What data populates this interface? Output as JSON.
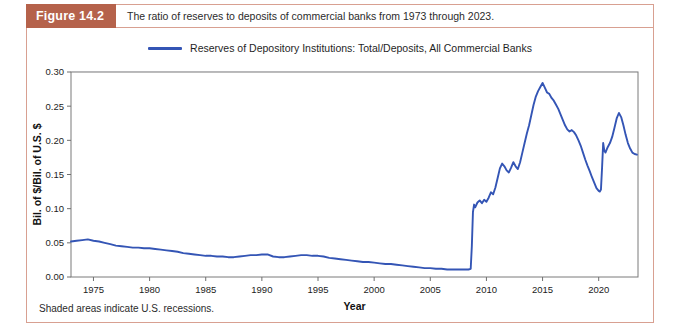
{
  "figure": {
    "tag": "Figure 14.2",
    "caption": "The ratio of reserves to deposits of commercial banks from 1973 through 2023.",
    "footnote": "Shaded areas indicate U.S. recessions.",
    "tag_bg_color": "#b5624b",
    "border_color": "#d8a091"
  },
  "chart_data": {
    "type": "line",
    "title": "",
    "xlabel": "Year",
    "ylabel": "Bil. of $/Bil. of U.S. $",
    "xlim": [
      1973,
      2023.5
    ],
    "ylim": [
      0.0,
      0.3
    ],
    "xticks": [
      1975,
      1980,
      1985,
      1990,
      1995,
      2000,
      2005,
      2010,
      2015,
      2020
    ],
    "yticks": [
      0.0,
      0.05,
      0.1,
      0.15,
      0.2,
      0.25,
      0.3
    ],
    "xtick_labels": [
      "1975",
      "1980",
      "1985",
      "1990",
      "1995",
      "2000",
      "2005",
      "2010",
      "2015",
      "2020"
    ],
    "ytick_labels": [
      "0.00",
      "0.05",
      "0.10",
      "0.15",
      "0.20",
      "0.25",
      "0.30"
    ],
    "grid": true,
    "legend_position": "top-center",
    "line_color": "#3455b5",
    "recession_color": "#dde7ee",
    "series": [
      {
        "name": "Reserves of Depository Institutions: Total/Deposits, All Commercial Banks",
        "color": "#3455b5",
        "x": [
          1973.0,
          1973.5,
          1974.0,
          1974.5,
          1975.0,
          1975.5,
          1976.0,
          1976.5,
          1977.0,
          1977.5,
          1978.0,
          1978.5,
          1979.0,
          1979.5,
          1980.0,
          1980.5,
          1981.0,
          1981.5,
          1982.0,
          1982.5,
          1983.0,
          1983.5,
          1984.0,
          1984.5,
          1985.0,
          1985.5,
          1986.0,
          1986.5,
          1987.0,
          1987.5,
          1988.0,
          1988.5,
          1989.0,
          1989.5,
          1990.0,
          1990.5,
          1991.0,
          1991.5,
          1992.0,
          1992.5,
          1993.0,
          1993.5,
          1994.0,
          1994.5,
          1995.0,
          1995.5,
          1996.0,
          1996.5,
          1997.0,
          1997.5,
          1998.0,
          1998.5,
          1999.0,
          1999.5,
          2000.0,
          2000.5,
          2001.0,
          2001.5,
          2002.0,
          2002.5,
          2003.0,
          2003.5,
          2004.0,
          2004.5,
          2005.0,
          2005.5,
          2006.0,
          2006.5,
          2007.0,
          2007.5,
          2008.0,
          2008.4,
          2008.6,
          2008.7,
          2008.8,
          2008.9,
          2009.0,
          2009.2,
          2009.4,
          2009.6,
          2009.8,
          2010.0,
          2010.2,
          2010.4,
          2010.6,
          2010.8,
          2011.0,
          2011.2,
          2011.4,
          2011.6,
          2011.8,
          2012.0,
          2012.2,
          2012.4,
          2012.6,
          2012.8,
          2013.0,
          2013.2,
          2013.4,
          2013.6,
          2013.8,
          2014.0,
          2014.2,
          2014.4,
          2014.6,
          2014.8,
          2015.0,
          2015.2,
          2015.4,
          2015.6,
          2015.8,
          2016.0,
          2016.2,
          2016.4,
          2016.6,
          2016.8,
          2017.0,
          2017.2,
          2017.4,
          2017.6,
          2017.8,
          2018.0,
          2018.2,
          2018.4,
          2018.6,
          2018.8,
          2019.0,
          2019.2,
          2019.4,
          2019.6,
          2019.8,
          2020.0,
          2020.1,
          2020.2,
          2020.3,
          2020.4,
          2020.5,
          2020.6,
          2020.8,
          2021.0,
          2021.2,
          2021.4,
          2021.6,
          2021.8,
          2022.0,
          2022.2,
          2022.4,
          2022.6,
          2022.8,
          2023.0,
          2023.2,
          2023.4
        ],
        "y": [
          0.052,
          0.053,
          0.054,
          0.055,
          0.053,
          0.052,
          0.05,
          0.048,
          0.046,
          0.045,
          0.044,
          0.043,
          0.043,
          0.042,
          0.042,
          0.041,
          0.04,
          0.039,
          0.038,
          0.037,
          0.035,
          0.034,
          0.033,
          0.032,
          0.031,
          0.031,
          0.03,
          0.03,
          0.029,
          0.029,
          0.03,
          0.031,
          0.032,
          0.032,
          0.033,
          0.033,
          0.03,
          0.029,
          0.029,
          0.03,
          0.031,
          0.032,
          0.032,
          0.031,
          0.031,
          0.03,
          0.028,
          0.027,
          0.026,
          0.025,
          0.024,
          0.023,
          0.022,
          0.022,
          0.021,
          0.02,
          0.019,
          0.019,
          0.018,
          0.017,
          0.016,
          0.015,
          0.014,
          0.013,
          0.013,
          0.012,
          0.012,
          0.011,
          0.011,
          0.011,
          0.011,
          0.011,
          0.012,
          0.045,
          0.095,
          0.106,
          0.102,
          0.109,
          0.112,
          0.108,
          0.113,
          0.11,
          0.116,
          0.124,
          0.121,
          0.131,
          0.145,
          0.159,
          0.166,
          0.162,
          0.156,
          0.153,
          0.16,
          0.168,
          0.162,
          0.158,
          0.168,
          0.182,
          0.196,
          0.21,
          0.222,
          0.237,
          0.252,
          0.264,
          0.272,
          0.278,
          0.284,
          0.277,
          0.27,
          0.268,
          0.262,
          0.258,
          0.252,
          0.246,
          0.238,
          0.23,
          0.222,
          0.216,
          0.213,
          0.215,
          0.212,
          0.207,
          0.2,
          0.192,
          0.182,
          0.172,
          0.163,
          0.155,
          0.146,
          0.138,
          0.13,
          0.126,
          0.125,
          0.128,
          0.16,
          0.196,
          0.185,
          0.182,
          0.19,
          0.196,
          0.205,
          0.218,
          0.232,
          0.24,
          0.234,
          0.222,
          0.208,
          0.196,
          0.188,
          0.182,
          0.18,
          0.179
        ]
      }
    ],
    "recessions": [
      {
        "start": 1973.9,
        "end": 1975.2,
        "label": "1973-75 recession"
      },
      {
        "start": 1980.1,
        "end": 1980.5,
        "label": "1980 recession"
      },
      {
        "start": 1981.5,
        "end": 1982.9,
        "label": "1981-82 recession"
      },
      {
        "start": 1990.6,
        "end": 1991.2,
        "label": "1990-91 recession"
      },
      {
        "start": 2001.2,
        "end": 2001.9,
        "label": "2001 recession"
      },
      {
        "start": 2007.9,
        "end": 2009.5,
        "label": "2007-09 recession"
      },
      {
        "start": 2020.1,
        "end": 2020.4,
        "label": "2020 recession"
      }
    ],
    "legend": [
      {
        "label": "Reserves of Depository Institutions: Total/Deposits, All Commercial Banks",
        "color": "#3455b5"
      }
    ]
  }
}
